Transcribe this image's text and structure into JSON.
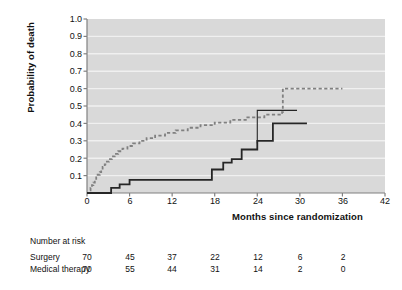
{
  "chart_data": {
    "type": "line",
    "title": "",
    "xlabel": "Months since randomization",
    "ylabel": "Probability of death",
    "xlim": [
      0,
      42
    ],
    "ylim": [
      0,
      1.0
    ],
    "xticks": [
      0,
      6,
      12,
      18,
      24,
      30,
      36,
      42
    ],
    "xtick_labels": [
      "0",
      "6",
      "12",
      "18",
      "24",
      "30",
      "36",
      "42"
    ],
    "yticks": [
      0.1,
      0.2,
      0.3,
      0.4,
      0.5,
      0.6,
      0.7,
      0.8,
      0.9,
      1.0
    ],
    "ytick_labels": [
      "0.1",
      "0.2",
      "0.3",
      "0.4",
      "0.5",
      "0.6",
      "0.7",
      "0.8",
      "0.9",
      "1.0"
    ],
    "grid": "horizontal",
    "plot_background": "#d9d9d9",
    "legend": "inline-annotations",
    "annotations": [
      {
        "name": "p-value",
        "text": "P<0.001",
        "x": 14.0,
        "y": 0.83
      },
      {
        "name": "surgery-label",
        "text": "Surgery",
        "x": 32.5,
        "y": 0.66
      },
      {
        "name": "medical-therapy-label",
        "text": "Medical therapy",
        "x": 30.0,
        "y": 0.47
      }
    ],
    "series": [
      {
        "name": "Surgery",
        "style": "dashed",
        "color": "#808080",
        "points": [
          [
            0.0,
            0.0
          ],
          [
            0.3,
            0.015
          ],
          [
            0.5,
            0.03
          ],
          [
            0.7,
            0.045
          ],
          [
            0.9,
            0.06
          ],
          [
            1.1,
            0.075
          ],
          [
            1.3,
            0.09
          ],
          [
            1.5,
            0.105
          ],
          [
            1.8,
            0.12
          ],
          [
            2.0,
            0.135
          ],
          [
            2.2,
            0.15
          ],
          [
            2.5,
            0.165
          ],
          [
            2.8,
            0.18
          ],
          [
            3.1,
            0.195
          ],
          [
            3.5,
            0.21
          ],
          [
            3.9,
            0.225
          ],
          [
            4.4,
            0.24
          ],
          [
            5.0,
            0.255
          ],
          [
            5.7,
            0.27
          ],
          [
            6.5,
            0.285
          ],
          [
            7.4,
            0.3
          ],
          [
            8.4,
            0.315
          ],
          [
            9.6,
            0.33
          ],
          [
            11.0,
            0.345
          ],
          [
            12.5,
            0.36
          ],
          [
            14.2,
            0.375
          ],
          [
            16.0,
            0.39
          ],
          [
            18.0,
            0.405
          ],
          [
            20.2,
            0.42
          ],
          [
            22.6,
            0.435
          ],
          [
            25.0,
            0.45
          ],
          [
            27.5,
            0.465
          ],
          [
            27.6,
            0.6
          ],
          [
            36.0,
            0.6
          ]
        ]
      },
      {
        "name": "Medical therapy",
        "style": "solid",
        "color": "#262626",
        "points": [
          [
            0.0,
            0.0
          ],
          [
            3.4,
            0.0
          ],
          [
            3.4,
            0.03
          ],
          [
            4.6,
            0.03
          ],
          [
            4.6,
            0.05
          ],
          [
            6.0,
            0.05
          ],
          [
            6.0,
            0.075
          ],
          [
            17.6,
            0.075
          ],
          [
            17.6,
            0.135
          ],
          [
            19.2,
            0.135
          ],
          [
            19.2,
            0.175
          ],
          [
            20.4,
            0.175
          ],
          [
            20.4,
            0.195
          ],
          [
            21.8,
            0.195
          ],
          [
            21.8,
            0.25
          ],
          [
            24.0,
            0.25
          ],
          [
            24.0,
            0.3
          ],
          [
            26.2,
            0.3
          ],
          [
            26.2,
            0.4
          ],
          [
            31.0,
            0.4
          ]
        ]
      }
    ],
    "numbers_at_risk": {
      "title": "Number at risk",
      "columns": [
        0,
        6,
        12,
        18,
        24,
        30,
        36
      ],
      "rows": [
        {
          "label": "Surgery",
          "values": [
            "70",
            "45",
            "37",
            "22",
            "12",
            "6",
            "2"
          ]
        },
        {
          "label": "Medical therapy",
          "values": [
            "70",
            "55",
            "44",
            "31",
            "14",
            "2",
            "0"
          ]
        }
      ]
    },
    "colors": {
      "surgery": "#808080",
      "medical": "#262626",
      "plot_bg": "#d9d9d9",
      "gridline": "#f0f0f0",
      "axis": "#808080",
      "text": "#111111"
    }
  }
}
